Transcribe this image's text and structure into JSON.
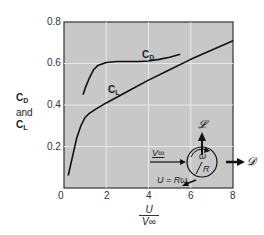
{
  "chart_data": {
    "type": "line",
    "title": "",
    "xlabel": "U / V∞",
    "ylabel": "CD and CL",
    "xlim": [
      0,
      8
    ],
    "ylim": [
      0,
      0.8
    ],
    "x_ticks": [
      "0",
      "2",
      "4",
      "6",
      "8"
    ],
    "y_ticks": [
      "0.2",
      "0.4",
      "0.6",
      "0.8"
    ],
    "grid": true,
    "legend": "inline curve labels",
    "series": [
      {
        "name": "CD",
        "x": [
          0.9,
          1.0,
          1.2,
          1.4,
          1.6,
          2.0,
          2.5,
          3.0,
          3.5,
          4.0,
          4.5,
          5.0,
          5.5
        ],
        "values": [
          0.45,
          0.48,
          0.53,
          0.57,
          0.59,
          0.605,
          0.61,
          0.61,
          0.61,
          0.612,
          0.62,
          0.63,
          0.645
        ]
      },
      {
        "name": "CL",
        "x": [
          0.2,
          0.4,
          0.6,
          0.8,
          1.0,
          1.2,
          1.5,
          2.0,
          3.0,
          4.0,
          5.0,
          6.0,
          7.0,
          8.0
        ],
        "values": [
          0.06,
          0.15,
          0.24,
          0.3,
          0.34,
          0.36,
          0.38,
          0.41,
          0.465,
          0.52,
          0.57,
          0.62,
          0.665,
          0.71
        ]
      }
    ],
    "annotations": [
      "CD",
      "CL",
      "𝓛",
      "V∞",
      "ω",
      "R",
      "U = Rω",
      "𝓓"
    ]
  },
  "labels": {
    "y_top": "C",
    "y_top_sub": "D",
    "y_mid": "and",
    "y_bot": "C",
    "y_bot_sub": "L",
    "x_num": "U",
    "x_den": "V∞",
    "curve_cd": "C",
    "curve_cd_sub": "D",
    "curve_cl": "C",
    "curve_cl_sub": "L",
    "ticks_x": [
      "0",
      "2",
      "4",
      "6",
      "8"
    ],
    "ticks_y": [
      "0.8",
      "0.6",
      "0.4",
      "0.2"
    ]
  },
  "diagram": {
    "lift": "𝓛",
    "drag": "𝓓",
    "freestream": "V∞",
    "omega": "ω",
    "radius": "R",
    "surface_speed": "U = Rω"
  },
  "colors": {
    "plot_bg": "#c8c8c8",
    "grid": "#e6e6e6",
    "curve": "#111111",
    "frame": "#333333"
  }
}
